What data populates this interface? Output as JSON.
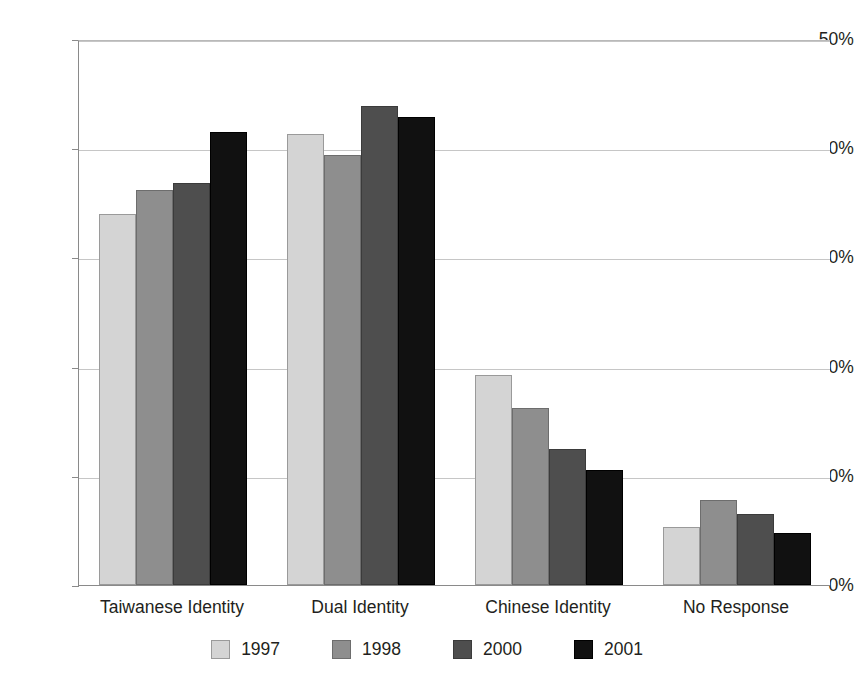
{
  "chart_data": {
    "type": "bar",
    "title": "",
    "subtitle": "",
    "xlabel": "",
    "ylabel": "",
    "categories": [
      "Taiwanese Identity",
      "Dual Identity",
      "Chinese Identity",
      "No Response"
    ],
    "series": [
      {
        "name": "1997",
        "color": "#d4d4d4",
        "values": [
          34.0,
          41.3,
          19.2,
          5.3
        ]
      },
      {
        "name": "1998",
        "color": "#8e8e8e",
        "values": [
          36.2,
          39.4,
          16.2,
          7.8
        ]
      },
      {
        "name": "2000",
        "color": "#4e4e4e",
        "values": [
          36.8,
          43.9,
          12.5,
          6.5
        ]
      },
      {
        "name": "2001",
        "color": "#111111",
        "values": [
          41.5,
          42.9,
          10.5,
          4.8
        ]
      }
    ],
    "ylim": [
      0,
      50
    ],
    "ytick_values": [
      0,
      10,
      20,
      30,
      40,
      50
    ],
    "ytick_labels": [
      "0%",
      "10%",
      "20%",
      "30%",
      "40%",
      "50%"
    ],
    "grid": true,
    "legend_position": "bottom",
    "value_suffix": "%"
  },
  "axes": {
    "y": {
      "ticks": [
        {
          "label": "50%",
          "value": 50
        },
        {
          "label": "40%",
          "value": 40
        },
        {
          "label": "30%",
          "value": 30
        },
        {
          "label": "20%",
          "value": 20
        },
        {
          "label": "10%",
          "value": 10
        },
        {
          "label": "0%",
          "value": 0
        }
      ]
    },
    "x": {
      "categories": [
        {
          "label": "Taiwanese Identity"
        },
        {
          "label": "Dual Identity"
        },
        {
          "label": "Chinese Identity"
        },
        {
          "label": "No Response"
        }
      ]
    }
  },
  "legend": {
    "items": [
      {
        "label": "1997",
        "color": "#d4d4d4"
      },
      {
        "label": "1998",
        "color": "#8e8e8e"
      },
      {
        "label": "2000",
        "color": "#4e4e4e"
      },
      {
        "label": "2001",
        "color": "#111111"
      }
    ]
  }
}
